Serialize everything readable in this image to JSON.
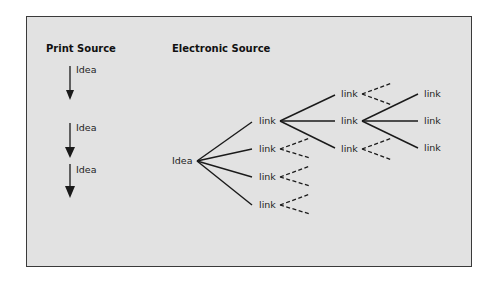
{
  "diagram": {
    "colors": {
      "panel_bg": "#e2e2e2",
      "border": "#3a3a3a",
      "ink": "#1a1a1a"
    },
    "print_source": {
      "title": "Print Source",
      "steps": [
        {
          "label": "Idea"
        },
        {
          "label": "Idea"
        },
        {
          "label": "Idea"
        }
      ]
    },
    "electronic_source": {
      "title": "Electronic Source",
      "root": "Idea",
      "level1": [
        "link",
        "link",
        "link",
        "link"
      ],
      "level2": [
        "link",
        "link",
        "link"
      ],
      "level3": [
        "link",
        "link",
        "link"
      ]
    }
  }
}
